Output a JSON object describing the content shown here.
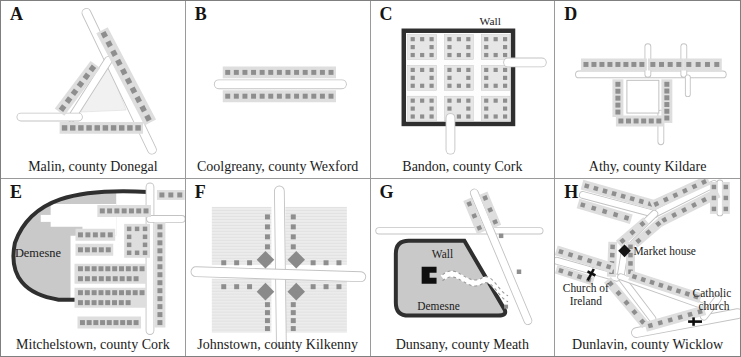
{
  "figure": {
    "colors": {
      "building": "#8e8e8e",
      "strip": "#dedede",
      "road_edge": "#c3c3c3",
      "road_fill": "#ffffff",
      "wall": "#2f2f2f",
      "demesne_fill": "#c9c9c9",
      "block_fill": "#e6e6e6",
      "grid_line": "#9a9a9a",
      "text": "#1b1b1b"
    },
    "panels": [
      {
        "letter": "A",
        "caption": "Malin, county Donegal"
      },
      {
        "letter": "B",
        "caption": "Coolgreany, county Wexford"
      },
      {
        "letter": "C",
        "caption": "Bandon, county Cork",
        "labels": {
          "wall": "Wall"
        }
      },
      {
        "letter": "D",
        "caption": "Athy, county Kildare"
      },
      {
        "letter": "E",
        "caption": "Mitchelstown, county Cork",
        "labels": {
          "demesne": "Demesne"
        }
      },
      {
        "letter": "F",
        "caption": "Johnstown, county Kilkenny"
      },
      {
        "letter": "G",
        "caption": "Dunsany, county Meath",
        "labels": {
          "wall": "Wall",
          "demesne": "Demesne"
        }
      },
      {
        "letter": "H",
        "caption": "Dunlavin, county Wicklow",
        "labels": {
          "market_house": "Market house",
          "church_of_ireland_lines": [
            "Church of",
            "Ireland"
          ],
          "catholic_church_lines": [
            "Catholic",
            "church"
          ]
        }
      }
    ]
  }
}
